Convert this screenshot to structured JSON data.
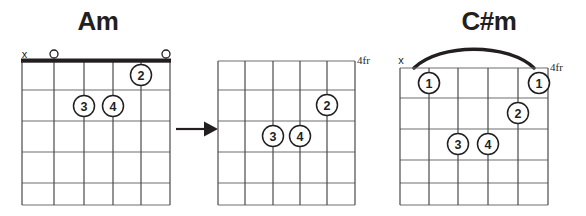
{
  "page": {
    "background_color": "#ffffff",
    "ink_color": "#231f20",
    "grid_line_color": "#6e6e6e",
    "nut_color": "#231f20",
    "diagram_count": 3
  },
  "diagrams": [
    {
      "id": "am-open-chord",
      "title": "Am",
      "title_has_sharp": false,
      "show_nut": true,
      "fret_label": "",
      "barre": null,
      "strings": 6,
      "frets": 5,
      "string_markers": [
        "x",
        "o",
        "",
        "",
        "",
        "o"
      ],
      "fingerings": [
        {
          "finger": "2",
          "string": 5,
          "fret": 1
        },
        {
          "finger": "3",
          "string": 3,
          "fret": 2
        },
        {
          "finger": "4",
          "string": 4,
          "fret": 2
        }
      ]
    },
    {
      "id": "shifted-shape-4fr",
      "title": "",
      "title_has_sharp": false,
      "show_nut": false,
      "fret_label": "4fr",
      "barre": null,
      "strings": 6,
      "frets": 5,
      "string_markers": [
        "",
        "",
        "",
        "",
        "",
        ""
      ],
      "fingerings": [
        {
          "finger": "2",
          "string": 5,
          "fret": 2
        },
        {
          "finger": "3",
          "string": 3,
          "fret": 3
        },
        {
          "finger": "4",
          "string": 4,
          "fret": 3
        }
      ]
    },
    {
      "id": "c-sharp-minor-barre-chord",
      "title": "C#m",
      "title_has_sharp": true,
      "title_parts": {
        "root": "C",
        "accidental": "#",
        "quality": "m"
      },
      "show_nut": false,
      "fret_label": "4fr",
      "barre": {
        "from_string": 2,
        "to_string": 6,
        "fret": 1,
        "finger": "1"
      },
      "strings": 6,
      "frets": 5,
      "string_markers": [
        "x",
        "",
        "",
        "",
        "",
        ""
      ],
      "fingerings": [
        {
          "finger": "1",
          "string": 2,
          "fret": 1
        },
        {
          "finger": "1",
          "string": 6,
          "fret": 1
        },
        {
          "finger": "2",
          "string": 5,
          "fret": 2
        },
        {
          "finger": "3",
          "string": 3,
          "fret": 3
        },
        {
          "finger": "4",
          "string": 4,
          "fret": 3
        }
      ]
    }
  ],
  "arrows": [
    {
      "id": "transform-arrow",
      "direction": "right",
      "after_diagram": 0
    }
  ],
  "legend": {
    "mute_symbol": "x",
    "open_symbol": "o",
    "fret_suffix": "fr"
  }
}
